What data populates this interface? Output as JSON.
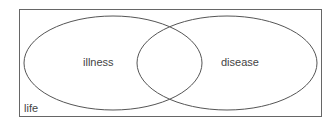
{
  "diagram": {
    "type": "venn",
    "universe": {
      "label": "life"
    },
    "sets": [
      {
        "label": "illness"
      },
      {
        "label": "disease"
      }
    ],
    "colors": {
      "stroke": "#555555",
      "background": "#ffffff",
      "text": "#444444"
    }
  }
}
